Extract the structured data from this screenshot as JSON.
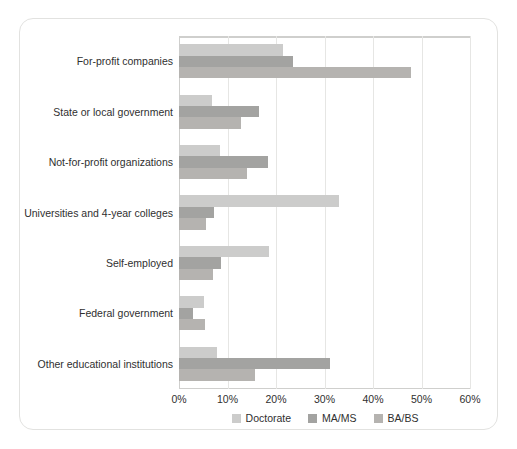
{
  "chart_data": {
    "type": "bar",
    "orientation": "horizontal",
    "title": "",
    "xlabel": "",
    "ylabel": "",
    "xlim": [
      0,
      60
    ],
    "xtick_values": [
      0,
      10,
      20,
      30,
      40,
      50,
      60
    ],
    "xtick_labels": [
      "0%",
      "10%",
      "20%",
      "30%",
      "40%",
      "50%",
      "60%"
    ],
    "grid": "vertical",
    "legend_position": "bottom-center",
    "categories": [
      "For-profit companies",
      "State or local government",
      "Not-for-profit organizations",
      "Universities and 4-year colleges",
      "Self-employed",
      "Federal government",
      "Other educational institutions"
    ],
    "series": [
      {
        "name": "Doctorate",
        "color": "#cccccb",
        "values": [
          21.5,
          6.8,
          8.5,
          32.9,
          18.5,
          5.2,
          7.8
        ]
      },
      {
        "name": "MA/MS",
        "color": "#a3a3a1",
        "values": [
          23.6,
          16.4,
          18.3,
          7.2,
          8.7,
          2.8,
          31.1
        ]
      },
      {
        "name": "BA/BS",
        "color": "#b5b3b0",
        "values": [
          47.9,
          12.7,
          14.1,
          5.5,
          7.0,
          5.4,
          15.7
        ]
      }
    ]
  },
  "colors": {
    "card_background": "#ffffff",
    "card_border": "#e2e2e0",
    "gridline": "#e6e6e4",
    "axis": "#cfcfcd",
    "text": "#2f2f2f"
  }
}
